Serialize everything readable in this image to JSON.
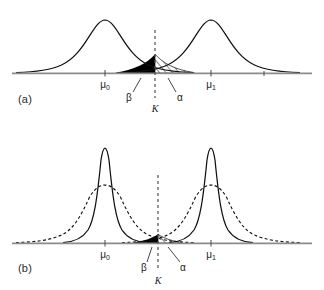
{
  "figure": {
    "background_color": "#ffffff",
    "axis_color": "#8c8c8c",
    "curve_color": "#111111",
    "beta_region_color": "#000000",
    "alpha_region_fill": "hatched"
  },
  "panels": [
    {
      "id": "a",
      "label": "(a)",
      "description": "Two overlapping normal densities with equal, larger standard deviation; wide overlap gives large alpha and beta regions.",
      "axis": {
        "x_start": 12,
        "x_end": 312,
        "baseline_y": 73
      },
      "curves": [
        {
          "name": "null-distribution",
          "style": "solid",
          "mean_label": "μ₀",
          "mean_x": 105,
          "peak_y": 20,
          "sigma": 31
        },
        {
          "name": "alternative-distribution",
          "style": "solid",
          "mean_label": "μ₁",
          "mean_x": 211,
          "peak_y": 20,
          "sigma": 31
        }
      ],
      "critical_value": {
        "label": "K",
        "x": 155,
        "line_style": "dashed"
      },
      "regions": [
        {
          "name": "beta-region",
          "label": "β",
          "fill": "solid-black",
          "side": "left-of-K",
          "label_x": 131,
          "label_y": 92
        },
        {
          "name": "alpha-region",
          "label": "α",
          "fill": "diagonal-hatch",
          "side": "right-of-K",
          "label_x": 176,
          "label_y": 92
        }
      ],
      "tick_labels": [
        {
          "text": "μ₀",
          "x": 105,
          "y": 86
        },
        {
          "text": "μ₁",
          "x": 211,
          "y": 86
        }
      ]
    },
    {
      "id": "b",
      "label": "(b)",
      "description": "Same means with smaller standard deviation (solid, larger sample size) overlaid on the original wider densities (dashed); overlap and both error regions shrink.",
      "axis": {
        "x_start": 12,
        "x_end": 312,
        "baseline_y": 243
      },
      "curves": [
        {
          "name": "null-distribution-large-n",
          "style": "solid",
          "mean_label": "μ₀",
          "mean_x": 105,
          "peak_y": 148,
          "sigma": 19
        },
        {
          "name": "alternative-distribution-large-n",
          "style": "solid",
          "mean_label": "μ₁",
          "mean_x": 211,
          "peak_y": 148,
          "sigma": 19
        },
        {
          "name": "null-distribution-small-n",
          "style": "dashed",
          "mean_label": "μ₀",
          "mean_x": 105,
          "peak_y": 185,
          "sigma": 31
        },
        {
          "name": "alternative-distribution-small-n",
          "style": "dashed",
          "mean_label": "μ₁",
          "mean_x": 211,
          "peak_y": 185,
          "sigma": 31
        }
      ],
      "critical_value": {
        "label": "K",
        "x": 158,
        "line_style": "dashed"
      },
      "regions": [
        {
          "name": "beta-region",
          "label": "β",
          "fill": "solid-black",
          "side": "left-of-K",
          "label_x": 144,
          "label_y": 262
        },
        {
          "name": "alpha-region",
          "label": "α",
          "fill": "diagonal-hatch",
          "side": "right-of-K",
          "label_x": 180,
          "label_y": 262
        }
      ],
      "tick_labels": [
        {
          "text": "μ₀",
          "x": 105,
          "y": 256
        },
        {
          "text": "μ₁",
          "x": 211,
          "y": 256
        }
      ]
    }
  ],
  "labels": {
    "mu0": "μ",
    "mu0_sub": "0",
    "mu1": "μ",
    "mu1_sub": "1",
    "alpha": "α",
    "beta": "β",
    "k": "K",
    "panel_a": "(a)",
    "panel_b": "(b)"
  }
}
